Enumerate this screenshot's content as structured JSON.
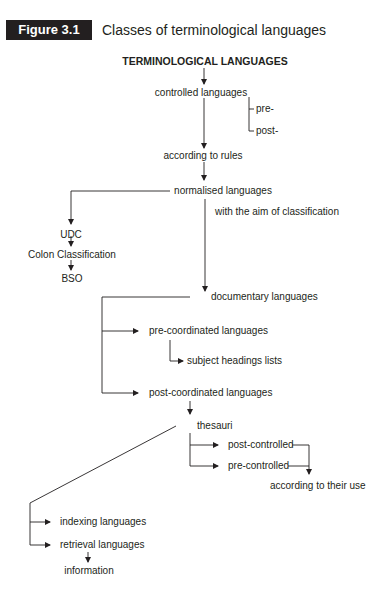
{
  "figure": {
    "number_label": "Figure 3.1",
    "title": "Classes of terminological languages",
    "badge_color": "#231f20"
  },
  "nodes": {
    "root": "TERMINOLOGICAL LANGUAGES",
    "controlled": "controlled languages",
    "pre": "pre-",
    "post": "post-",
    "rules": "according to rules",
    "normalised": "normalised languages",
    "aim": "with the aim of classification",
    "udc": "UDC",
    "colon": "Colon Classification",
    "bso": "BSO",
    "documentary": "documentary languages",
    "precoord": "pre-coordinated languages",
    "subject": "subject headings lists",
    "postcoord": "post-coordinated languages",
    "thesauri": "thesauri",
    "postcontrolled": "post-controlled",
    "precontrolled": "pre-controlled",
    "use": "according to their use",
    "indexing": "indexing languages",
    "retrieval": "retrieval languages",
    "information": "information"
  },
  "edges": [
    {
      "from": "root",
      "to": "controlled"
    },
    {
      "from": "controlled",
      "to": "pre"
    },
    {
      "from": "controlled",
      "to": "post"
    },
    {
      "from": "controlled",
      "to": "rules"
    },
    {
      "from": "rules",
      "to": "normalised"
    },
    {
      "from": "normalised",
      "to": "udc"
    },
    {
      "from": "udc",
      "to": "colon"
    },
    {
      "from": "colon",
      "to": "bso"
    },
    {
      "from": "normalised",
      "to": "documentary",
      "label": "with the aim of classification"
    },
    {
      "from": "documentary",
      "to": "precoord"
    },
    {
      "from": "precoord",
      "to": "subject"
    },
    {
      "from": "documentary",
      "to": "postcoord"
    },
    {
      "from": "postcoord",
      "to": "thesauri"
    },
    {
      "from": "thesauri",
      "to": "postcontrolled"
    },
    {
      "from": "thesauri",
      "to": "precontrolled"
    },
    {
      "from": "postcontrolled",
      "to": "use"
    },
    {
      "from": "precontrolled",
      "to": "use"
    },
    {
      "from": "thesauri",
      "to": "indexing"
    },
    {
      "from": "thesauri",
      "to": "retrieval"
    },
    {
      "from": "retrieval",
      "to": "information"
    }
  ]
}
